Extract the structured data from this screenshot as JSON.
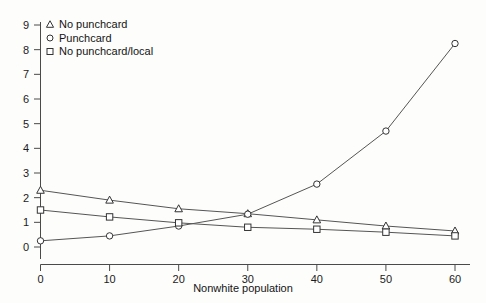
{
  "chart_data": {
    "type": "line",
    "title": "",
    "xlabel": "Nonwhite population",
    "ylabel": "",
    "x": [
      0,
      10,
      20,
      30,
      40,
      50,
      60
    ],
    "xlim": [
      0,
      60
    ],
    "ylim": [
      0,
      9
    ],
    "xticks": [
      "0",
      "10",
      "20",
      "30",
      "40",
      "50",
      "60"
    ],
    "yticks": [
      "0",
      "1",
      "2",
      "3",
      "4",
      "5",
      "6",
      "7",
      "8",
      "9"
    ],
    "grid": false,
    "legend_position": "top-left",
    "series": [
      {
        "name": "No punchcard",
        "marker": "triangle",
        "values": [
          2.3,
          1.9,
          1.55,
          1.35,
          1.1,
          0.85,
          0.65
        ]
      },
      {
        "name": "Punchcard",
        "marker": "circle",
        "values": [
          0.25,
          0.45,
          0.85,
          1.33,
          2.55,
          4.7,
          8.25
        ]
      },
      {
        "name": "No punchcard/local",
        "marker": "square",
        "values": [
          1.5,
          1.22,
          0.98,
          0.8,
          0.72,
          0.6,
          0.45
        ]
      }
    ]
  },
  "legend": {
    "items": [
      {
        "label": "No punchcard",
        "marker": "triangle-marker"
      },
      {
        "label": "Punchcard",
        "marker": "circle-marker"
      },
      {
        "label": "No punchcard/local",
        "marker": "square-marker"
      }
    ]
  },
  "axes": {
    "x_title": "Nonwhite population"
  }
}
